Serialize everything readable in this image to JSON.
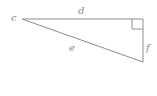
{
  "diagram": {
    "type": "right-triangle",
    "labels": {
      "vertex": "c",
      "top_side": "d",
      "hypotenuse": "e",
      "right_side": "f"
    },
    "colors": {
      "stroke": "#8c8c8c",
      "text": "#8a8a8a",
      "background": "#ffffff"
    }
  }
}
